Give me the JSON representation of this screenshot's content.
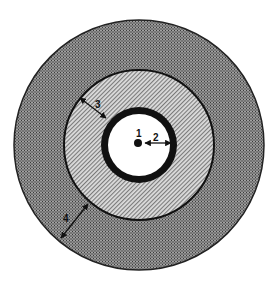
{
  "diagram": {
    "type": "concentric-circles",
    "center": [
      139,
      145
    ],
    "colors": {
      "background": "#ffffff",
      "outer_ring": "#7a7a7a",
      "middle_ring": "#c4c4c4",
      "inner_band": "#111111",
      "core": "#ffffff",
      "ink": "#111111"
    },
    "regions": [
      {
        "id": "outer-ring",
        "radius": 125,
        "pattern": "dense-crosshatch"
      },
      {
        "id": "middle-ring",
        "radius": 75,
        "pattern": "diagonal-hatch"
      },
      {
        "id": "inner-band",
        "radius": 38,
        "thickness": 7,
        "pattern": "solid-black"
      },
      {
        "id": "core",
        "radius": 31,
        "pattern": "white"
      },
      {
        "id": "center-dot",
        "radius": 4,
        "pattern": "solid-black"
      }
    ],
    "labels": [
      {
        "id": "1",
        "text": "1",
        "x": 139,
        "y": 136
      },
      {
        "id": "2",
        "text": "2",
        "x": 157,
        "y": 140
      },
      {
        "id": "3",
        "text": "3",
        "x": 98,
        "y": 105
      },
      {
        "id": "4",
        "text": "4",
        "x": 67,
        "y": 219
      }
    ],
    "arrows": [
      {
        "id": "2",
        "from": [
          145,
          143
        ],
        "to": [
          171,
          143
        ]
      },
      {
        "id": "3",
        "from": [
          80,
          98
        ],
        "to": [
          106,
          118
        ]
      },
      {
        "id": "4",
        "from": [
          61,
          238
        ],
        "to": [
          88,
          204
        ]
      }
    ]
  }
}
